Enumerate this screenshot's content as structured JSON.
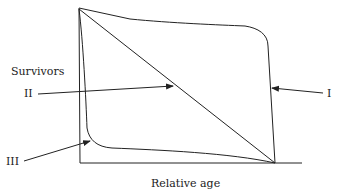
{
  "diagram": {
    "y_axis_label": "Survivors",
    "x_axis_label": "Relative age",
    "curves": [
      {
        "id": "I",
        "label": "I",
        "description": "High survival until late age, then steep drop"
      },
      {
        "id": "II",
        "label": "II",
        "description": "Constant mortality — straight diagonal line"
      },
      {
        "id": "III",
        "label": "III",
        "description": "Steep early drop, then low survival flattening out"
      }
    ],
    "line_color": "#222222"
  }
}
